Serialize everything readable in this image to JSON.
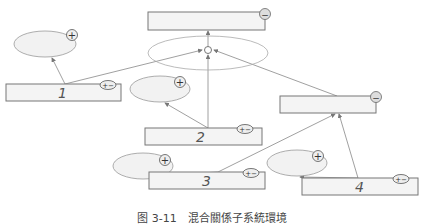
{
  "diagram": {
    "boxes": [
      {
        "id": "top",
        "label": ""
      },
      {
        "id": "1",
        "label": "1"
      },
      {
        "id": "2",
        "label": "2"
      },
      {
        "id": "right",
        "label": ""
      },
      {
        "id": "3",
        "label": "3"
      },
      {
        "id": "4",
        "label": "4"
      }
    ],
    "symbols": {
      "plus": "+",
      "minus": "−",
      "plus_minus": "+−"
    }
  },
  "caption": "图 3-11　混合關係子系統環境"
}
